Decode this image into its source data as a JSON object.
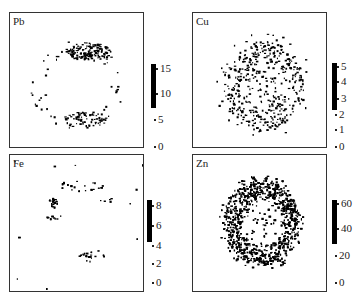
{
  "panels": [
    {
      "id": "pb",
      "element": "Pb",
      "ticks": [
        "15",
        "10",
        "5",
        "0"
      ],
      "cbar_min": 7,
      "cbar_max": 16
    },
    {
      "id": "cu",
      "element": "Cu",
      "ticks": [
        "5",
        "4",
        "3",
        "2",
        "1",
        "0"
      ],
      "cbar_min": 2.6,
      "cbar_max": 5.2
    },
    {
      "id": "fe",
      "element": "Fe",
      "ticks": [
        "8",
        "6",
        "4",
        "2",
        "0"
      ],
      "cbar_min": 4,
      "cbar_max": 8.6
    },
    {
      "id": "zn",
      "element": "Zn",
      "ticks": [
        "60",
        "40",
        "20",
        "0"
      ],
      "cbar_min": 30,
      "cbar_max": 62
    }
  ],
  "chart_data": [
    {
      "type": "heatmap",
      "title": "Pb",
      "colorbar": {
        "ticks": [
          0,
          5,
          10,
          15
        ],
        "range": [
          0,
          16
        ]
      },
      "pattern": "ring with dense arcs at top and bottom",
      "legend": "none"
    },
    {
      "type": "heatmap",
      "title": "Cu",
      "colorbar": {
        "ticks": [
          0,
          1,
          2,
          3,
          4,
          5
        ],
        "range": [
          0,
          5.2
        ]
      },
      "pattern": "scattered speckle over circular region",
      "legend": "none"
    },
    {
      "type": "heatmap",
      "title": "Fe",
      "colorbar": {
        "ticks": [
          0,
          2,
          4,
          6,
          8
        ],
        "range": [
          0,
          8.6
        ]
      },
      "pattern": "sparse clusters, hotspot at left",
      "legend": "none"
    },
    {
      "type": "heatmap",
      "title": "Zn",
      "colorbar": {
        "ticks": [
          0,
          20,
          40,
          60
        ],
        "range": [
          0,
          62
        ]
      },
      "pattern": "dense ring (annulus) with lighter center",
      "legend": "none"
    }
  ]
}
